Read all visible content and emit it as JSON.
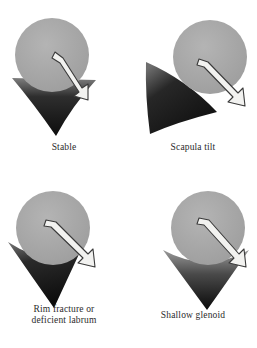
{
  "figure": {
    "panel_count": 4,
    "colors": {
      "background": "#ffffff",
      "humeral_head": "#a8a8a8",
      "humeral_head_edge": "#9a9a9a",
      "glenoid_dark": "#121212",
      "glenoid_light": "#8d8d8d",
      "arrow_fill": "#f2f2f0",
      "arrow_outline": "#3a3a3a",
      "caption_text": "#2b2b2b"
    }
  },
  "panels": [
    {
      "id": "stable",
      "caption_lines": [
        "Stable"
      ],
      "humeral_head": {
        "cx": 52,
        "cy": 55,
        "r": 37
      },
      "glenoid": {
        "shape": "deep-symmetric-v",
        "apex": {
          "x": 56,
          "y": 136
        },
        "left": {
          "x": 12,
          "y": 78
        },
        "right": {
          "x": 96,
          "y": 80
        }
      },
      "arrow": {
        "tail": {
          "x": 59,
          "y": 56
        },
        "head": {
          "x": 86,
          "y": 96
        },
        "angle_deg": 56,
        "direction": "down-right",
        "description": "force vector contained within deep socket"
      }
    },
    {
      "id": "scapula-tilt",
      "caption_lines": [
        "Scapula tilt"
      ],
      "humeral_head": {
        "cx": 81,
        "cy": 57,
        "r": 37
      },
      "glenoid": {
        "shape": "tilted-wedge",
        "apex": {
          "x": 21,
          "y": 134
        },
        "left": {
          "x": 17,
          "y": 62
        },
        "right": {
          "x": 88,
          "y": 112
        }
      },
      "arrow": {
        "tail": {
          "x": 74,
          "y": 63
        },
        "head": {
          "x": 115,
          "y": 105
        },
        "angle_deg": 46,
        "direction": "down-right",
        "description": "vector escapes over tilted inferior rim"
      }
    },
    {
      "id": "rim-fracture",
      "caption_lines": [
        "Rim fracture or",
        "deficient labrum"
      ],
      "humeral_head": {
        "cx": 53,
        "cy": 54,
        "r": 37
      },
      "glenoid": {
        "shape": "v-with-truncated-rim",
        "apex": {
          "x": 54,
          "y": 134
        },
        "left": {
          "x": 8,
          "y": 68
        },
        "right": {
          "x": 80,
          "y": 78
        },
        "defect": "right superior rim shortened"
      },
      "arrow": {
        "tail": {
          "x": 52,
          "y": 48
        },
        "head": {
          "x": 96,
          "y": 92
        },
        "angle_deg": 45,
        "direction": "down-right",
        "description": "vector passes beyond deficient rim"
      }
    },
    {
      "id": "shallow-glenoid",
      "caption_lines": [
        "Shallow glenoid"
      ],
      "humeral_head": {
        "cx": 79,
        "cy": 54,
        "r": 37
      },
      "glenoid": {
        "shape": "wide-shallow-v",
        "apex": {
          "x": 78,
          "y": 136
        },
        "left": {
          "x": 34,
          "y": 76
        },
        "right": {
          "x": 120,
          "y": 76
        }
      },
      "arrow": {
        "tail": {
          "x": 76,
          "y": 46
        },
        "head": {
          "x": 118,
          "y": 92
        },
        "angle_deg": 48,
        "direction": "down-right",
        "description": "vector exits shallow socket laterally"
      }
    }
  ]
}
